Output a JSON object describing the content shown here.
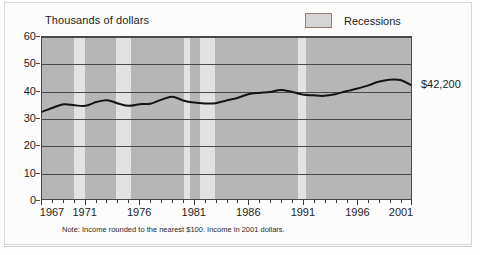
{
  "figure": {
    "axis_title": "Thousands of dollars",
    "note": "Note: Income rounded to the nearest $100. Income in 2001 dollars.",
    "end_value_label": "$42,200"
  },
  "legend": {
    "items": [
      {
        "label": "Recessions",
        "swatch_color": "#e2e2e2",
        "swatch_border": "#9c7b73"
      }
    ]
  },
  "colors": {
    "plot_background": "#b6b6b6",
    "recession_band": "#e2e2e2",
    "gridline": "#4a4a4a",
    "series_line": "#141414",
    "page_background": "#fdfdfd"
  },
  "chart_data": {
    "type": "line",
    "title": "",
    "subtitle": "",
    "xlabel": "",
    "ylabel": "Thousands of dollars",
    "xlim": [
      1967,
      2001
    ],
    "ylim": [
      0,
      60
    ],
    "yticks": [
      0,
      10,
      20,
      30,
      40,
      50,
      60
    ],
    "ytick_labels": [
      "0",
      "10",
      "20",
      "30",
      "40",
      "50",
      "60"
    ],
    "xticks": [
      1967,
      1971,
      1976,
      1981,
      1986,
      1991,
      1996,
      2001
    ],
    "xtick_labels": [
      "1967",
      "1971",
      "1976",
      "1981",
      "1986",
      "1991",
      "1996",
      "2001"
    ],
    "x_minor_tick_interval": 1,
    "grid": true,
    "grid_axis": "y",
    "legend_position": "top-right",
    "annotations": [
      {
        "text": "$42,200",
        "x": 2001,
        "y": 42.2,
        "position": "right-of-line-end"
      }
    ],
    "series": [
      {
        "name": "Median household income",
        "units": "thousands of 2001 dollars",
        "x": [
          1967,
          1968,
          1969,
          1970,
          1971,
          1972,
          1973,
          1974,
          1975,
          1976,
          1977,
          1978,
          1979,
          1980,
          1981,
          1982,
          1983,
          1984,
          1985,
          1986,
          1987,
          1988,
          1989,
          1990,
          1991,
          1992,
          1993,
          1994,
          1995,
          1996,
          1997,
          1998,
          1999,
          2000,
          2001
        ],
        "values": [
          32.3,
          33.8,
          35.1,
          34.7,
          34.5,
          35.9,
          36.6,
          35.4,
          34.5,
          35.1,
          35.3,
          36.8,
          37.9,
          36.5,
          35.7,
          35.4,
          35.5,
          36.5,
          37.4,
          38.8,
          39.3,
          39.6,
          40.4,
          39.7,
          38.7,
          38.4,
          38.2,
          38.8,
          39.9,
          40.8,
          42.0,
          43.4,
          44.2,
          44.1,
          42.2
        ]
      }
    ],
    "recession_bands": [
      {
        "start": 1969.9,
        "end": 1970.9
      },
      {
        "start": 1973.8,
        "end": 1975.2
      },
      {
        "start": 1980.0,
        "end": 1980.6
      },
      {
        "start": 1981.5,
        "end": 1982.9
      },
      {
        "start": 1990.5,
        "end": 1991.2
      },
      {
        "start": 2001.2,
        "end": 2001.9
      }
    ]
  }
}
